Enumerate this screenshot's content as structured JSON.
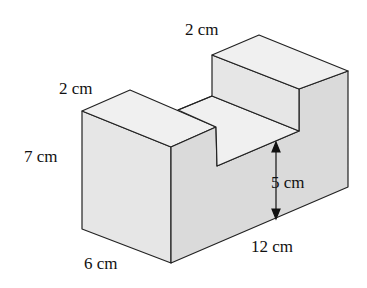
{
  "figure": {
    "type": "3D solid with notch (U-shaped block)",
    "colors": {
      "top_face": "#f0f0f0",
      "front_face": "#e6e6e6",
      "side_face": "#d9d9d9",
      "edge": "#222222"
    },
    "labels": {
      "top_right_width": "2 cm",
      "top_left_width": "2 cm",
      "height": "7 cm",
      "notch_depth": "5 cm",
      "depth": "6 cm",
      "length": "12 cm"
    }
  }
}
